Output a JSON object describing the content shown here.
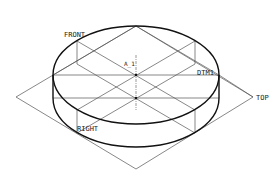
{
  "diagram": {
    "type": "cad-isometric-view",
    "colors": {
      "background": "#ffffff",
      "edges": "#111111",
      "datums": "#555555",
      "labels": "#222222"
    },
    "labels": {
      "front": "FRONT",
      "dtm1": "DTM1",
      "top": "TOP",
      "right": "RIGHT",
      "axis": "A_1"
    }
  }
}
